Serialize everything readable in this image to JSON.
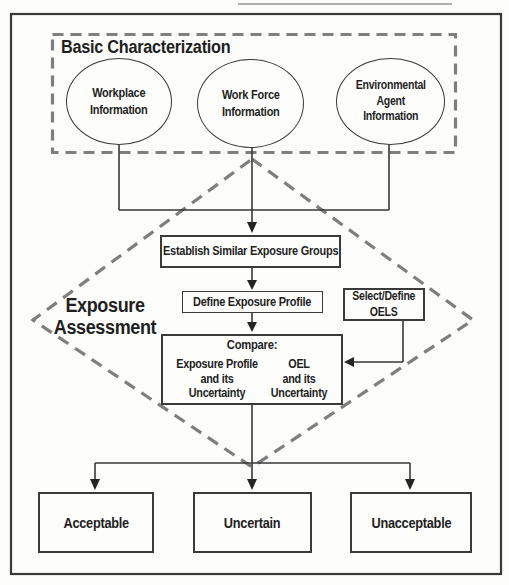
{
  "colors": {
    "background": "#fcfcfb",
    "solid_line": "#383838",
    "dashed_line": "#7e7e7e",
    "text": "#1f1f1f",
    "scan_artifact": "#999999"
  },
  "basic_characterization": {
    "title": "Basic Characterization",
    "ellipses": [
      {
        "label": "Workplace\nInformation"
      },
      {
        "label": "Work Force\nInformation"
      },
      {
        "label": "Environmental\nAgent\nInformation"
      }
    ]
  },
  "exposure_assessment": {
    "label": "Exposure\nAssessment",
    "establish_box": "Establish Similar Exposure Groups",
    "define_box": "Define Exposure Profile",
    "oels_box": "Select/Define\nOELS",
    "compare": {
      "title": "Compare:",
      "left": "Exposure Profile\nand its\nUncertainty",
      "right": "OEL\nand its\nUncertainty"
    }
  },
  "outcomes": [
    {
      "label": "Acceptable"
    },
    {
      "label": "Uncertain"
    },
    {
      "label": "Unacceptable"
    }
  ]
}
